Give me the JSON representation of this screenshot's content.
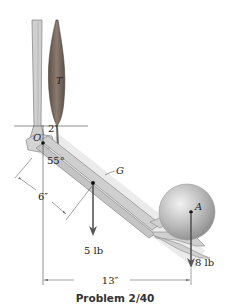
{
  "figure": {
    "caption": "Problem 2/40",
    "labels": {
      "muscle_tension": "T",
      "pivot": "O",
      "center_of_gravity": "G",
      "ball_point": "A",
      "angle": "55°",
      "muscle_offset": "2″",
      "forearm_cg_distance": "6″",
      "horizontal_distance": "13″",
      "forearm_weight": "5 lb",
      "ball_weight": "8 lb"
    },
    "colors": {
      "bone": "#c9c9c9",
      "bone_edge": "#8a8a8a",
      "muscle": "#7a6a60",
      "ball": "#b5b5b5",
      "arrow": "#555555",
      "shadow": "#d9d9d9"
    }
  }
}
